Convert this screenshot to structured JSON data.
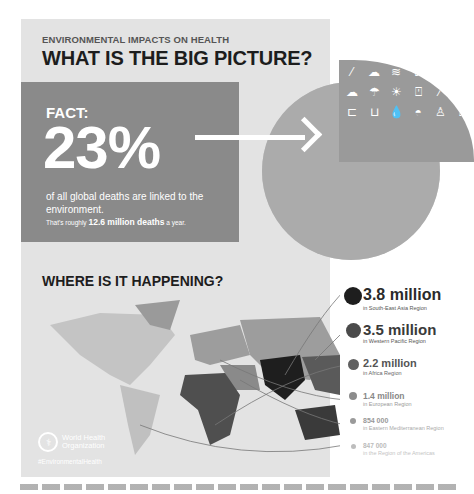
{
  "header": {
    "kicker": "ENVIRONMENTAL IMPACTS ON HEALTH",
    "headline": "WHAT IS THE BIG PICTURE?"
  },
  "fact": {
    "label": "FACT:",
    "percent": "23%",
    "description": "of all global deaths are linked to the environment.",
    "sub_prefix": "That's roughly",
    "sub_bold": "12.6 million deaths",
    "sub_suffix": "a year."
  },
  "graphic": {
    "icons": [
      "cigarette-icon",
      "sun-cloud-icon",
      "water-waves-icon",
      "toilet-icon",
      "water-drop-icon",
      "car-icon",
      "sun-cloud-icon",
      "rain-cloud-icon",
      "sunset-waves-icon",
      "bottle-icon",
      "cigarette-icon",
      "sun-cloud-icon",
      "car-icon",
      "toilet-icon",
      "water-drop-icon",
      "sunrise-icon",
      "person-icon",
      "bottle-icon"
    ]
  },
  "map_section": {
    "title": "WHERE IS IT HAPPENING?"
  },
  "regions": [
    {
      "value": "3.8 million",
      "region": "in South-East Asia Region",
      "color": "#1e1e1e"
    },
    {
      "value": "3.5 million",
      "region": "in Western Pacific Region",
      "color": "#4a4a4a"
    },
    {
      "value": "2.2 million",
      "region": "in Africa Region",
      "color": "#606060"
    },
    {
      "value": "1.4 million",
      "region": "in European Region",
      "color": "#8c8c8c"
    },
    {
      "value": "854 000",
      "region": "in Eastern Mediterranean Region",
      "color": "#9a9a9a"
    },
    {
      "value": "847 000",
      "region": "in the Region of the Americas",
      "color": "#bdbdbd"
    }
  ],
  "footer": {
    "org_line1": "World Health",
    "org_line2": "Organization",
    "hashtag": "#EnvironmentalHealth"
  }
}
